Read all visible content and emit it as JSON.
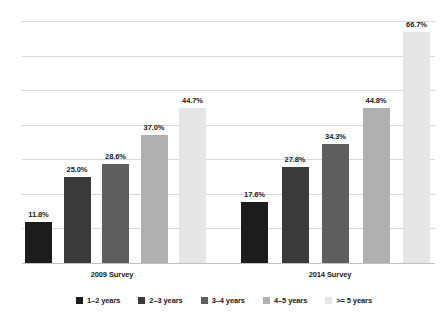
{
  "chart_data": {
    "type": "bar",
    "title": "",
    "subtitle": "",
    "xlabel": "",
    "ylabel": "",
    "ylim": [
      0,
      70
    ],
    "grid": true,
    "gridline_values": [
      0,
      10,
      20,
      30,
      40,
      50,
      60,
      70
    ],
    "legend_position": "bottom",
    "value_suffix": "%",
    "categories": [
      "2009 Survey",
      "2014 Survey"
    ],
    "series": [
      {
        "name": "1–2 years",
        "color": "#1c1c1c",
        "values": [
          11.8,
          17.6
        ],
        "labels": [
          "11.8%",
          "17.6%"
        ]
      },
      {
        "name": "2–3 years",
        "color": "#3a3a3a",
        "values": [
          25.0,
          27.8
        ],
        "labels": [
          "25.0%",
          "27.8%"
        ]
      },
      {
        "name": "3–4 years",
        "color": "#5e5e5e",
        "values": [
          28.6,
          34.3
        ],
        "labels": [
          "28.6%",
          "34.3%"
        ]
      },
      {
        "name": "4–5 years",
        "color": "#b0b0b0",
        "values": [
          37.0,
          44.8
        ],
        "labels": [
          "37.0%",
          "44.8%"
        ]
      },
      {
        "name": ">= 5 years",
        "color": "#e6e6e6",
        "values": [
          44.7,
          66.7
        ],
        "labels": [
          "44.7%",
          "66.7%"
        ]
      }
    ]
  },
  "axis": {
    "category_labels": [
      "2009 Survey",
      "2014 Survey"
    ]
  },
  "legend": {
    "items": [
      {
        "label": "1–2 years"
      },
      {
        "label": "2–3 years"
      },
      {
        "label": "3–4 years"
      },
      {
        "label": "4–5 years"
      },
      {
        "label": ">= 5 years"
      }
    ]
  }
}
